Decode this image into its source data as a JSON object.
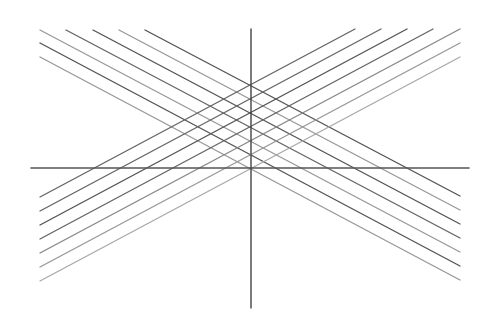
{
  "diagram": {
    "width": 491,
    "height": 317,
    "background": "#ffffff",
    "axes": {
      "horizontal": {
        "x1": 31,
        "y1": 168,
        "x2": 469,
        "y2": 168,
        "color": "#555555",
        "width": 1.6
      },
      "vertical": {
        "x1": 251,
        "y1": 29,
        "x2": 251,
        "y2": 308,
        "color": "#444444",
        "width": 1.4
      }
    },
    "descending_lines": [
      {
        "x1": 145,
        "y1": 30,
        "x2": 460,
        "y2": 196,
        "color": "#555555"
      },
      {
        "x1": 119,
        "y1": 30,
        "x2": 460,
        "y2": 210,
        "color": "#999999"
      },
      {
        "x1": 93,
        "y1": 30,
        "x2": 460,
        "y2": 224,
        "color": "#555555"
      },
      {
        "x1": 66,
        "y1": 30,
        "x2": 460,
        "y2": 238,
        "color": "#666666"
      },
      {
        "x1": 40,
        "y1": 30,
        "x2": 460,
        "y2": 252,
        "color": "#999999"
      },
      {
        "x1": 40,
        "y1": 43,
        "x2": 460,
        "y2": 266,
        "color": "#555555"
      },
      {
        "x1": 40,
        "y1": 57,
        "x2": 460,
        "y2": 280,
        "color": "#999999"
      }
    ],
    "ascending_lines": [
      {
        "x1": 40,
        "y1": 197,
        "x2": 355,
        "y2": 29,
        "color": "#666666"
      },
      {
        "x1": 40,
        "y1": 211,
        "x2": 381,
        "y2": 29,
        "color": "#666666"
      },
      {
        "x1": 40,
        "y1": 225,
        "x2": 407,
        "y2": 29,
        "color": "#555555"
      },
      {
        "x1": 40,
        "y1": 239,
        "x2": 433,
        "y2": 29,
        "color": "#666666"
      },
      {
        "x1": 40,
        "y1": 253,
        "x2": 460,
        "y2": 29,
        "color": "#888888"
      },
      {
        "x1": 40,
        "y1": 267,
        "x2": 460,
        "y2": 43,
        "color": "#999999"
      },
      {
        "x1": 40,
        "y1": 281,
        "x2": 460,
        "y2": 57,
        "color": "#aaaaaa"
      }
    ],
    "line_width": 1.4
  }
}
